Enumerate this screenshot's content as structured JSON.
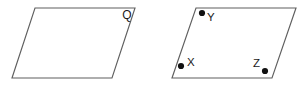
{
  "figure": {
    "type": "geometry-diagram",
    "background_color": "#ffffff",
    "stroke_color": "#5f5f5f",
    "dot_color": "#111111",
    "label_color": "#1a1a1a",
    "shapes": [
      {
        "id": "parallelogram-q",
        "name": "left-parallelogram",
        "label": "Q",
        "label_x": 127,
        "label_y": 19,
        "points": "35,8 135,8 112,78 12,78"
      },
      {
        "id": "parallelogram-xyz",
        "name": "right-parallelogram",
        "label": "",
        "points": "196,8 296,8 272,78 172,78"
      }
    ],
    "points": [
      {
        "id": "point-y",
        "label": "Y",
        "dot_x": 202,
        "dot_y": 13,
        "dot_r": 3.1,
        "label_x": 207,
        "label_y": 21
      },
      {
        "id": "point-x",
        "label": "X",
        "dot_x": 181,
        "dot_y": 66,
        "dot_r": 3.1,
        "label_x": 187,
        "label_y": 66
      },
      {
        "id": "point-z",
        "label": "Z",
        "dot_x": 265,
        "dot_y": 71,
        "dot_r": 3.1,
        "label_x": 253,
        "label_y": 67
      }
    ]
  }
}
